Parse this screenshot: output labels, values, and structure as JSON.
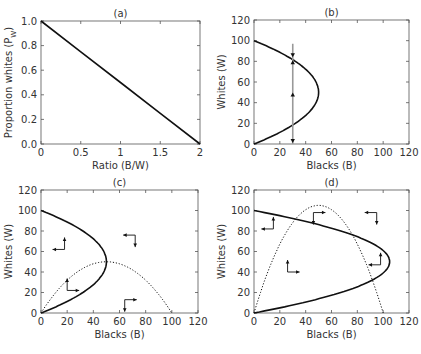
{
  "colors": {
    "axis": "#555555",
    "curve": "#111111",
    "gray_line": "#999999",
    "text": "#333333"
  },
  "chart_data": [
    {
      "id": "a",
      "type": "line",
      "title": "(a)",
      "xlabel": "Ratio (B/W)",
      "ylabel": "Proportion whites (P_W)",
      "xlim": [
        0,
        2
      ],
      "ylim": [
        0,
        1
      ],
      "xticks": [
        "0",
        "0.5",
        "1",
        "1.5",
        "2"
      ],
      "yticks": [
        "0.0",
        "0.2",
        "0.4",
        "0.6",
        "0.8",
        "1.0"
      ],
      "grid": false,
      "series": [
        {
          "name": "P_W = 1 - R/2",
          "style": "solid",
          "x": [
            0,
            0.5,
            1,
            1.5,
            2
          ],
          "y": [
            1.0,
            0.75,
            0.5,
            0.25,
            0.0
          ]
        }
      ]
    },
    {
      "id": "b",
      "type": "line",
      "title": "(b)",
      "xlabel": "Blacks (B)",
      "ylabel": "Whites (W)",
      "xlim": [
        0,
        120
      ],
      "ylim": [
        0,
        120
      ],
      "xticks": [
        "0",
        "20",
        "40",
        "60",
        "80",
        "100",
        "120"
      ],
      "yticks": [
        "0",
        "20",
        "40",
        "60",
        "80",
        "100",
        "120"
      ],
      "grid": false,
      "series": [
        {
          "name": "Whites isocline (B = W(100-W)/50)",
          "style": "solid",
          "curve": "B_of_W",
          "peak": 50
        },
        {
          "name": "Trajectory at B=30",
          "style": "gray-vertical",
          "x": 30,
          "y_range": [
            0,
            97
          ]
        }
      ],
      "annotations": [
        {
          "type": "arrow",
          "x": 30,
          "y": 86,
          "dir": "down"
        },
        {
          "type": "arrow",
          "x": 30,
          "y": 79,
          "dir": "up"
        },
        {
          "type": "arrow",
          "x": 30,
          "y": 48,
          "dir": "up"
        },
        {
          "type": "arrow",
          "x": 30,
          "y": 3,
          "dir": "down"
        }
      ]
    },
    {
      "id": "c",
      "type": "line",
      "title": "(c)",
      "xlabel": "Blacks (B)",
      "ylabel": "Whites (W)",
      "xlim": [
        0,
        120
      ],
      "ylim": [
        0,
        120
      ],
      "xticks": [
        "0",
        "20",
        "40",
        "60",
        "80",
        "100",
        "120"
      ],
      "yticks": [
        "0",
        "20",
        "40",
        "60",
        "80",
        "100",
        "120"
      ],
      "grid": false,
      "series": [
        {
          "name": "Whites isocline (B = W(100-W)/50)",
          "style": "solid",
          "curve": "B_of_W",
          "peak": 50
        },
        {
          "name": "Blacks isocline (W = B(100-B)/50)",
          "style": "dotted",
          "curve": "W_of_B",
          "peak": 50
        }
      ],
      "annotations": [
        {
          "type": "vector",
          "x": 18,
          "y": 62,
          "h": "left",
          "v": "up"
        },
        {
          "type": "vector",
          "x": 72,
          "y": 76,
          "h": "left",
          "v": "down"
        },
        {
          "type": "vector",
          "x": 20,
          "y": 22,
          "h": "right",
          "v": "up"
        },
        {
          "type": "vector",
          "x": 64,
          "y": 13,
          "h": "right",
          "v": "down"
        }
      ]
    },
    {
      "id": "d",
      "type": "line",
      "title": "(d)",
      "xlabel": "Blacks (B)",
      "ylabel": "Whites (W)",
      "xlim": [
        0,
        120
      ],
      "ylim": [
        0,
        120
      ],
      "xticks": [
        "0",
        "20",
        "40",
        "60",
        "80",
        "100",
        "120"
      ],
      "yticks": [
        "0",
        "20",
        "40",
        "60",
        "80",
        "100",
        "120"
      ],
      "grid": false,
      "series": [
        {
          "name": "Whites isocline (peak B≈105 at W=50)",
          "style": "solid",
          "curve": "B_of_W",
          "peak": 105
        },
        {
          "name": "Blacks isocline (peak W≈105 at B=50)",
          "style": "dotted",
          "curve": "W_of_B",
          "peak": 105
        }
      ],
      "annotations": [
        {
          "type": "vector",
          "x": 15,
          "y": 82,
          "h": "left",
          "v": "up"
        },
        {
          "type": "vector",
          "x": 46,
          "y": 98,
          "h": "right",
          "v": "down"
        },
        {
          "type": "vector",
          "x": 95,
          "y": 98,
          "h": "left",
          "v": "down"
        },
        {
          "type": "vector",
          "x": 98,
          "y": 47,
          "h": "left",
          "v": "up"
        },
        {
          "type": "vector",
          "x": 26,
          "y": 40,
          "h": "right",
          "v": "up"
        }
      ]
    }
  ],
  "panels_layout": [
    {
      "id": "a",
      "x0": 41,
      "x1": 200,
      "y0": 21,
      "y1": 144
    },
    {
      "id": "b",
      "x0": 254,
      "x1": 409,
      "y0": 20,
      "y1": 144
    },
    {
      "id": "c",
      "x0": 41,
      "x1": 198,
      "y0": 190,
      "y1": 313
    },
    {
      "id": "d",
      "x0": 254,
      "x1": 409,
      "y0": 190,
      "y1": 313
    }
  ]
}
